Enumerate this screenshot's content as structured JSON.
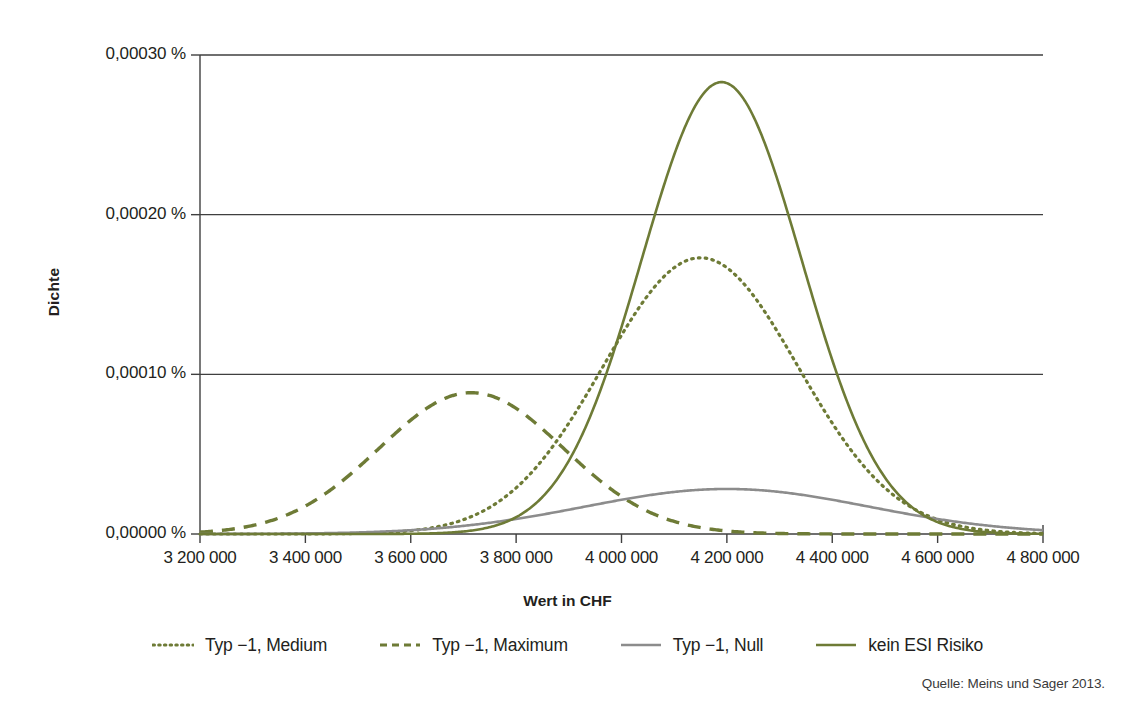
{
  "chart_data": {
    "type": "line",
    "title": "",
    "xlabel": "Wert in CHF",
    "ylabel": "Dichte",
    "xlim": [
      3200000,
      4800000
    ],
    "ylim": [
      0,
      0.0003
    ],
    "grid": "horizontal",
    "legend_position": "bottom",
    "xticks": [
      3200000,
      3400000,
      3600000,
      3800000,
      4000000,
      4200000,
      4400000,
      4600000,
      4800000
    ],
    "xtick_labels": [
      "3 200 000",
      "3 400 000",
      "3 600 000",
      "3 800 000",
      "4 000 000",
      "4 200 000",
      "4 400 000",
      "4 600 000",
      "4 800 000"
    ],
    "yticks": [
      0,
      0.0001,
      0.0002,
      0.0003
    ],
    "ytick_labels": [
      "0,00000 %",
      "0,00010 %",
      "0,00020 %",
      "0,00030 %"
    ],
    "series": [
      {
        "name": "Typ −1, Medium",
        "style": "dotted",
        "color": "#6E7B36",
        "peak_x": 4150000,
        "peak_y": 0.000173,
        "sigma": 185000,
        "x": [
          3200000,
          3300000,
          3400000,
          3500000,
          3600000,
          3700000,
          3800000,
          3900000,
          4000000,
          4100000,
          4150000,
          4200000,
          4300000,
          4400000,
          4500000,
          4600000,
          4700000,
          4800000
        ],
        "values": [
          0.0,
          0.0,
          1e-07,
          5e-07,
          2.6e-06,
          1.07e-05,
          3.4e-05,
          8.48e-05,
          0.0001487,
          0.0001712,
          0.000173,
          0.0001694,
          0.0001296,
          7.67e-05,
          3.36e-05,
          1.12e-05,
          2.8e-06,
          5e-07
        ]
      },
      {
        "name": "Typ −1, Maximum",
        "style": "dashed",
        "color": "#6E7B36",
        "peak_x": 3715000,
        "peak_y": 8.85e-05,
        "sigma": 175000,
        "x": [
          3200000,
          3300000,
          3400000,
          3500000,
          3600000,
          3700000,
          3715000,
          3800000,
          3900000,
          4000000,
          4100000,
          4200000,
          4300000,
          4400000,
          4500000,
          4600000,
          4700000,
          4800000
        ],
        "values": [
          2e-06,
          8e-06,
          2.15e-05,
          4.45e-05,
          7e-05,
          8.8e-05,
          8.85e-05,
          7.85e-05,
          5.3e-05,
          2.8e-05,
          1.18e-05,
          4.2e-06,
          1.4e-06,
          5e-07,
          2e-07,
          1e-07,
          0.0,
          0.0
        ]
      },
      {
        "name": "Typ −1, Null",
        "style": "solid",
        "color": "#8C8C8C",
        "peak_x": 4200000,
        "peak_y": 2.82e-05,
        "sigma": 270000,
        "x": [
          3200000,
          3400000,
          3600000,
          3700000,
          3800000,
          3900000,
          4000000,
          4100000,
          4200000,
          4300000,
          4400000,
          4500000,
          4600000,
          4700000,
          4800000
        ],
        "values": [
          0.0,
          2e-07,
          2e-06,
          4.8e-06,
          9.5e-06,
          1.6e-05,
          2.28e-05,
          2.73e-05,
          2.82e-05,
          2.57e-05,
          2e-05,
          1.35e-05,
          7.5e-06,
          3.2e-06,
          1e-06
        ]
      },
      {
        "name": "kein ESI Risiko",
        "style": "solid",
        "color": "#6E7B36",
        "peak_x": 4190000,
        "peak_y": 0.000283,
        "sigma": 152000,
        "x": [
          3200000,
          3400000,
          3600000,
          3700000,
          3800000,
          3900000,
          4000000,
          4100000,
          4190000,
          4300000,
          4400000,
          4500000,
          4600000,
          4700000,
          4800000
        ],
        "values": [
          0.0,
          0.0,
          3e-07,
          2e-06,
          1.1e-05,
          4.7e-05,
          0.000133,
          0.000244,
          0.000283,
          0.000238,
          0.000145,
          6.2e-05,
          1.8e-05,
          3.5e-06,
          5e-07
        ]
      }
    ]
  },
  "axis": {
    "ylabel": "Dichte",
    "xlabel": "Wert in CHF"
  },
  "legend": {
    "items": [
      {
        "label": "Typ −1, Medium",
        "style": "dotted",
        "color": "#6E7B36"
      },
      {
        "label": "Typ −1, Maximum",
        "style": "dashed",
        "color": "#6E7B36"
      },
      {
        "label": "Typ −1, Null",
        "style": "solid",
        "color": "#8C8C8C"
      },
      {
        "label": "kein ESI Risiko",
        "style": "solid",
        "color": "#6E7B36"
      }
    ]
  },
  "source": {
    "text": "Quelle: Meins und Sager 2013."
  },
  "colors": {
    "olive": "#6E7B36",
    "gray": "#8C8C8C",
    "axis": "#3f3f3f",
    "text": "#231f20",
    "background": "#ffffff"
  }
}
